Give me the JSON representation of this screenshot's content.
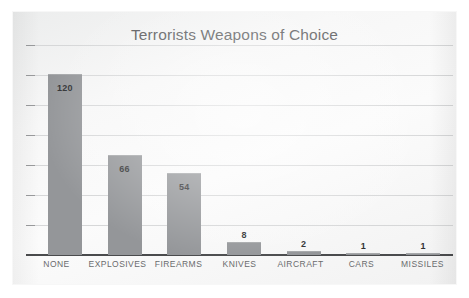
{
  "chart_data": {
    "type": "bar",
    "title": "Terrorists Weapons of Choice",
    "xlabel": "",
    "ylabel": "",
    "categories": [
      "NONE",
      "EXPLOSIVES",
      "FIREARMS",
      "KNIVES",
      "AIRCRAFT",
      "CARS",
      "MISSILES"
    ],
    "values": [
      120,
      66,
      54,
      8,
      2,
      1,
      1
    ],
    "value_labels": [
      "120",
      "66",
      "54",
      "8",
      "2",
      "1",
      "1"
    ],
    "ylim": [
      0,
      140
    ],
    "y_tick_values": [
      0,
      20,
      40,
      60,
      80,
      100,
      120,
      140
    ],
    "y_tick_labels_shown": false,
    "gridlines": true,
    "gridline_count": 7,
    "legend": null,
    "legend_position": "none",
    "orientation": "vertical",
    "bar_color": "#949699",
    "gridline_color": "#d6d7d8",
    "axis_color": "#4a4b4d",
    "title_color": "#58595b",
    "value_label_color": "#303133",
    "category_label_color": "#6a6b6d",
    "plot_background": "#f7f7f7"
  }
}
